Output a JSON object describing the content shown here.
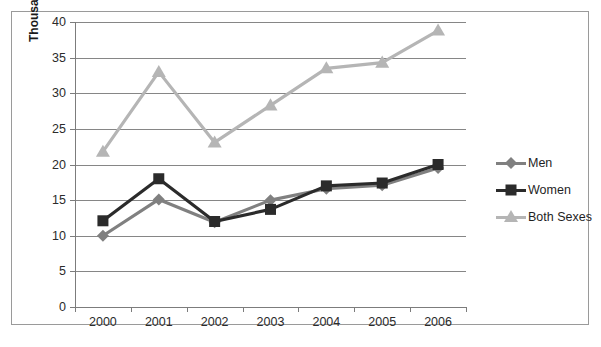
{
  "chart_data": {
    "type": "line",
    "title": "",
    "xlabel": "",
    "ylabel": "Thousands",
    "categories": [
      "2000",
      "2001",
      "2002",
      "2003",
      "2004",
      "2005",
      "2006"
    ],
    "ylim": [
      0,
      40
    ],
    "yticks": [
      0,
      5,
      10,
      15,
      20,
      25,
      30,
      35,
      40
    ],
    "ytick_labels": [
      "0",
      "5",
      "10",
      "15",
      "20",
      "25",
      "30",
      "35",
      "40"
    ],
    "grid": true,
    "legend_position": "right",
    "series": [
      {
        "name": "Men",
        "color": "#808080",
        "marker": "diamond",
        "values": [
          10.0,
          15.1,
          11.9,
          15.0,
          16.6,
          17.1,
          19.5
        ]
      },
      {
        "name": "Women",
        "color": "#2b2b2b",
        "marker": "square",
        "values": [
          12.1,
          18.0,
          12.0,
          13.7,
          17.0,
          17.4,
          20.0
        ]
      },
      {
        "name": "Both Sexes",
        "color": "#b5b5b5",
        "marker": "triangle",
        "values": [
          21.8,
          33.0,
          23.1,
          28.3,
          33.5,
          34.3,
          38.8
        ]
      }
    ]
  },
  "axis": {
    "y_title": "Thousands"
  },
  "legend": {
    "items": [
      {
        "label": "Men"
      },
      {
        "label": "Women"
      },
      {
        "label": "Both Sexes"
      }
    ]
  }
}
